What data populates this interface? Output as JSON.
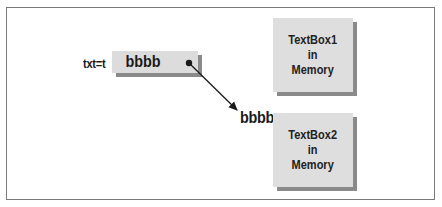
{
  "diagram": {
    "variable_label": "txt=t",
    "reference_value": "bbbb",
    "assigned_value": "bbbb",
    "memory_boxes": [
      {
        "lines": [
          "TextBox1",
          "in",
          "Memory"
        ]
      },
      {
        "lines": [
          "TextBox2",
          "in",
          "Memory"
        ]
      }
    ]
  },
  "colors": {
    "frame_border": "#7a7a7a",
    "box_fill": "#dcdcdc",
    "shadow": "#8a8a8a",
    "text": "#1a1a1a"
  }
}
